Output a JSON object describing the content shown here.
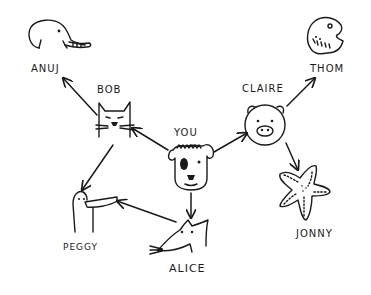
{
  "diagram": {
    "type": "social-graph",
    "style": "hand-drawn",
    "ink_color": "#1a1a1a",
    "background": "#ffffff",
    "nodes": [
      {
        "id": "you",
        "label": "YOU",
        "animal": "dog"
      },
      {
        "id": "bob",
        "label": "BOB",
        "animal": "cat"
      },
      {
        "id": "claire",
        "label": "CLAIRE",
        "animal": "pig"
      },
      {
        "id": "alice",
        "label": "ALICE",
        "animal": "rat"
      },
      {
        "id": "anuj",
        "label": "ANUJ",
        "animal": "elephant"
      },
      {
        "id": "peggy",
        "label": "PEGGY",
        "animal": "platypus"
      },
      {
        "id": "thom",
        "label": "THOM",
        "animal": "fish"
      },
      {
        "id": "jonny",
        "label": "JONNY",
        "animal": "starfish"
      }
    ],
    "edges": [
      {
        "from": "you",
        "to": "bob"
      },
      {
        "from": "you",
        "to": "claire"
      },
      {
        "from": "you",
        "to": "alice"
      },
      {
        "from": "bob",
        "to": "anuj"
      },
      {
        "from": "bob",
        "to": "peggy"
      },
      {
        "from": "alice",
        "to": "peggy"
      },
      {
        "from": "claire",
        "to": "thom"
      },
      {
        "from": "claire",
        "to": "jonny"
      }
    ]
  }
}
